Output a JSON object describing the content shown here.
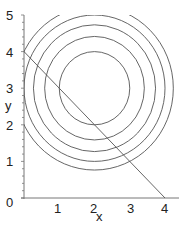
{
  "chart_data": {
    "type": "line",
    "title": "",
    "xlabel": "x",
    "ylabel": "y",
    "xlim": [
      0,
      4.4
    ],
    "ylim": [
      0,
      5
    ],
    "grid": false,
    "legend": null,
    "x_ticks": [
      "1",
      "2",
      "3",
      "4"
    ],
    "y_ticks": [
      "0",
      "1",
      "2",
      "3",
      "4",
      "5"
    ],
    "origin_label": "0",
    "contours": {
      "description": "Level curves (x-2)^2 + (y-3)^2 = c",
      "center": [
        2,
        3
      ],
      "levels": [
        1,
        2,
        3,
        4,
        5
      ],
      "radii": [
        1,
        1.414,
        1.732,
        2,
        2.236
      ]
    },
    "series": [
      {
        "name": "constraint line x + y = 4",
        "x": [
          0,
          4
        ],
        "y": [
          4,
          0
        ]
      }
    ],
    "colors": {
      "curves": "#555555",
      "axes": "#777777",
      "text": "#222222"
    }
  }
}
